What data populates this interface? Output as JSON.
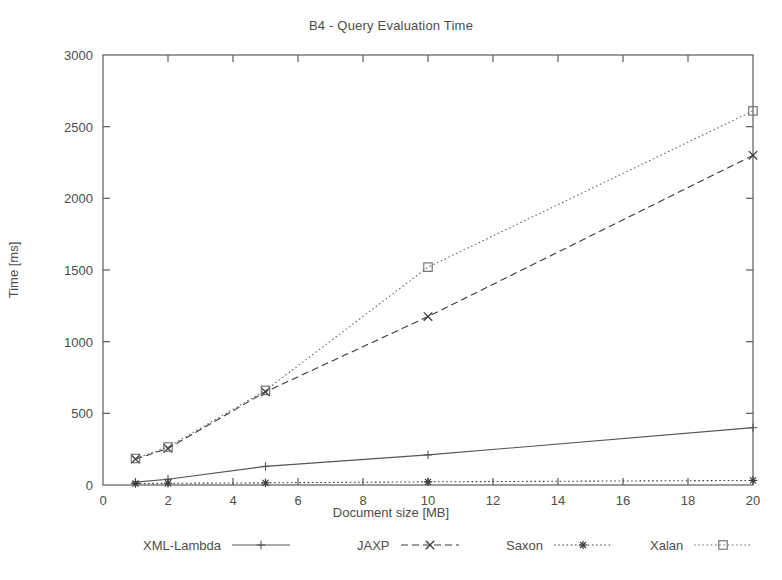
{
  "chart_data": {
    "type": "line",
    "title": "B4 - Query Evaluation Time",
    "xlabel": "Document size [MB]",
    "ylabel": "Time [ms]",
    "xlim": [
      0,
      20
    ],
    "ylim": [
      0,
      3000
    ],
    "xticks": [
      0,
      2,
      4,
      6,
      8,
      10,
      12,
      14,
      16,
      18,
      20
    ],
    "yticks": [
      0,
      500,
      1000,
      1500,
      2000,
      2500,
      3000
    ],
    "xtick_labels": [
      "0",
      "2",
      "4",
      "6",
      "8",
      "10",
      "12",
      "14",
      "16",
      "18",
      "20"
    ],
    "ytick_labels": [
      "0",
      "500",
      "1000",
      "1500",
      "2000",
      "2500",
      "3000"
    ],
    "grid": false,
    "legend_position": "below",
    "x": [
      1,
      2,
      5,
      10,
      20
    ],
    "series": [
      {
        "name": "XML-Lambda",
        "values": [
          20,
          40,
          130,
          210,
          400
        ],
        "line_style": "solid",
        "marker": "plus",
        "color": "#555555"
      },
      {
        "name": "JAXP",
        "values": [
          180,
          255,
          650,
          1175,
          2300
        ],
        "line_style": "dashed",
        "marker": "cross",
        "color": "#3a3a3a"
      },
      {
        "name": "Saxon",
        "values": [
          10,
          12,
          15,
          22,
          32
        ],
        "line_style": "dotted",
        "marker": "star",
        "color": "#3a3a3a"
      },
      {
        "name": "Xalan",
        "values": [
          185,
          265,
          660,
          1520,
          2610
        ],
        "line_style": "dotted",
        "marker": "square",
        "color": "#6a6a6a"
      }
    ]
  },
  "legend": {
    "items": [
      {
        "label": "XML-Lambda",
        "key_name": "legend-key-solid-plus"
      },
      {
        "label": "JAXP",
        "key_name": "legend-key-dashed-cross"
      },
      {
        "label": "Saxon",
        "key_name": "legend-key-dotted-star"
      },
      {
        "label": "Xalan",
        "key_name": "legend-key-dotted-square"
      }
    ]
  }
}
